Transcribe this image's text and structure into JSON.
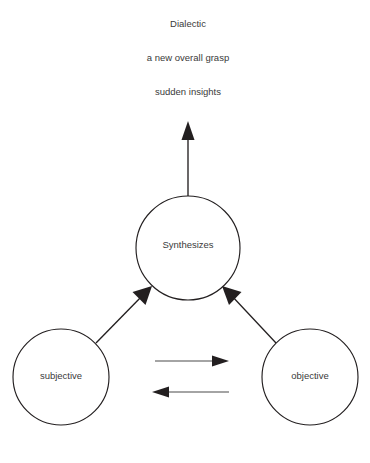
{
  "diagram": {
    "title": "Dialectic",
    "background_color": "#ffffff",
    "stroke_color": "#231f20",
    "text_color": "#3a3a3a",
    "captions": [
      {
        "id": "caption-title",
        "text": "Dialectic",
        "x": 188,
        "y": 24
      },
      {
        "id": "caption-grasp",
        "text": "a new overall grasp",
        "x": 188,
        "y": 58
      },
      {
        "id": "caption-insights",
        "text": "sudden insights",
        "x": 188,
        "y": 92
      }
    ],
    "nodes": [
      {
        "id": "node-synthesizes",
        "label": "Synthesizes",
        "cx": 188,
        "cy": 248,
        "r": 52
      },
      {
        "id": "node-subjective",
        "label": "subjective",
        "cx": 61,
        "cy": 377,
        "r": 48
      },
      {
        "id": "node-objective",
        "label": "objective",
        "cx": 310,
        "cy": 377,
        "r": 48
      }
    ],
    "edges": [
      {
        "id": "edge-synthesizes-up",
        "from": "node-synthesizes",
        "to": "caption-insights",
        "direction": "up",
        "x1": 188,
        "y1": 196,
        "x2": 188,
        "y2": 124
      },
      {
        "id": "edge-subjective-to-synthesizes",
        "from": "node-subjective",
        "to": "node-synthesizes",
        "direction": "up-right",
        "x1": 96,
        "y1": 343,
        "x2": 150,
        "y2": 288
      },
      {
        "id": "edge-objective-to-synthesizes",
        "from": "node-objective",
        "to": "node-synthesizes",
        "direction": "up-left",
        "x1": 276,
        "y1": 343,
        "x2": 224,
        "y2": 288
      },
      {
        "id": "edge-subjective-to-objective",
        "from": "node-subjective",
        "to": "node-objective",
        "direction": "right",
        "x1": 155,
        "y1": 361,
        "x2": 229,
        "y2": 361
      },
      {
        "id": "edge-objective-to-subjective",
        "from": "node-objective",
        "to": "node-subjective",
        "direction": "left",
        "x1": 229,
        "y1": 392,
        "x2": 152,
        "y2": 392
      }
    ]
  }
}
